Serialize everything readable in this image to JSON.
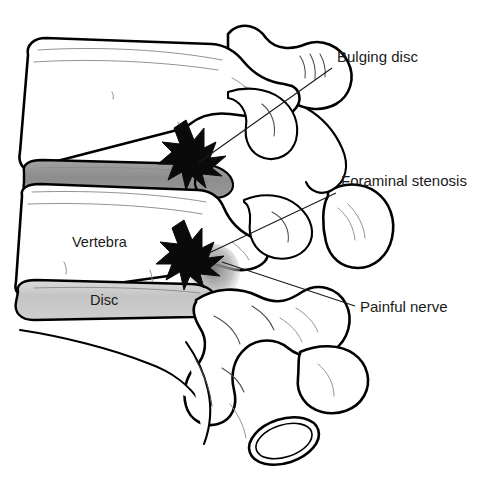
{
  "illustration": {
    "title": "Lumbar spine lateral view with bulging disc",
    "subject": "spine-cross-section",
    "background_color": "#ffffff",
    "line_color": "#000000",
    "text_color": "#1a1a1a"
  },
  "callouts": [
    {
      "id": "bulging-disc",
      "label": "Bulging disc",
      "text_x": 337,
      "text_y": 62,
      "leader": "M 332 68 L 198 163"
    },
    {
      "id": "foraminal-stenosis",
      "label": "Foraminal stenosis",
      "text_x": 341,
      "text_y": 186,
      "leader": "M 336 193 L 209 253"
    },
    {
      "id": "painful-nerve",
      "label": "Painful nerve",
      "text_x": 360,
      "text_y": 312,
      "leader": "M 355 306 L 222 262"
    }
  ],
  "inner_labels": [
    {
      "id": "vertebra",
      "label": "Vertebra",
      "x": 72,
      "y": 247
    },
    {
      "id": "disc",
      "label": "Disc",
      "x": 90,
      "y": 305
    }
  ],
  "anatomy": {
    "bulging_disc_color": "#909090",
    "normal_disc_color": "#c8c8c8",
    "nerve_shade_color": "#8f8f8f",
    "starburst_color": "#0a0a0a",
    "parts": [
      "upper-vertebral-body",
      "lower-vertebral-body",
      "bulging-disc",
      "normal-disc",
      "upper-spinous-process",
      "lower-spinous-process",
      "facet-joint",
      "sacrum",
      "foramen-oval",
      "pain-starburst-upper",
      "pain-starburst-lower"
    ]
  }
}
